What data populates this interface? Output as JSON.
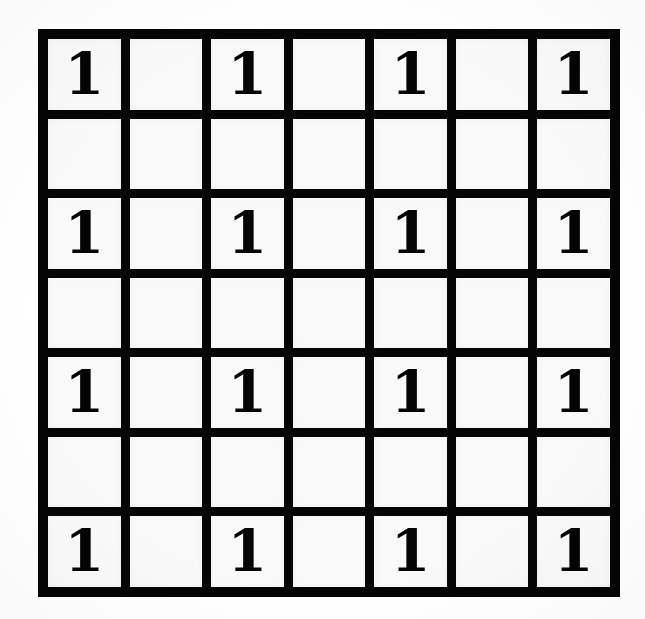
{
  "figure": {
    "kind": "grid-table",
    "title": "",
    "rows": 7,
    "columns": 7,
    "filled_token": "1",
    "empty_token": "",
    "line_color": "#0a0a0a",
    "cell_color": "#f4f4f4",
    "page_color": "#ffffff",
    "text_color": "#090909"
  },
  "chart_data": {
    "type": "table",
    "title": "",
    "xlabel": "",
    "ylabel": "",
    "row_labels": [
      "1",
      "2",
      "3",
      "4",
      "5",
      "6",
      "7"
    ],
    "column_labels": [
      "1",
      "2",
      "3",
      "4",
      "5",
      "6",
      "7"
    ],
    "grid": true,
    "legend": null,
    "note": "7x7 grid; the digit 1 occupies every cell where both the row index and the column index are odd (1,3,5,7). All other cells are blank.",
    "cells": [
      [
        "1",
        "",
        "1",
        "",
        "1",
        "",
        "1"
      ],
      [
        "",
        "",
        "",
        "",
        "",
        "",
        ""
      ],
      [
        "1",
        "",
        "1",
        "",
        "1",
        "",
        "1"
      ],
      [
        "",
        "",
        "",
        "",
        "",
        "",
        ""
      ],
      [
        "1",
        "",
        "1",
        "",
        "1",
        "",
        "1"
      ],
      [
        "",
        "",
        "",
        "",
        "",
        "",
        ""
      ],
      [
        "1",
        "",
        "1",
        "",
        "1",
        "",
        "1"
      ]
    ],
    "values": [
      [
        1,
        0,
        1,
        0,
        1,
        0,
        1
      ],
      [
        0,
        0,
        0,
        0,
        0,
        0,
        0
      ],
      [
        1,
        0,
        1,
        0,
        1,
        0,
        1
      ],
      [
        0,
        0,
        0,
        0,
        0,
        0,
        0
      ],
      [
        1,
        0,
        1,
        0,
        1,
        0,
        1
      ],
      [
        0,
        0,
        0,
        0,
        0,
        0,
        0
      ],
      [
        1,
        0,
        1,
        0,
        1,
        0,
        1
      ]
    ],
    "total_cells": 49,
    "filled_count": 16,
    "empty_count": 33
  }
}
